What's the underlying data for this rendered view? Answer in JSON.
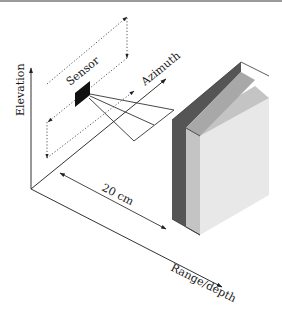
{
  "labels": {
    "elevation": "Elevation",
    "sensor": "Sensor",
    "azimuth": "Azimuth",
    "distance": "20 cm",
    "range": "Range/depth"
  },
  "colors": {
    "line": "#2a2a2a",
    "dotted": "#555555",
    "sensor": "#111111",
    "plate_dark": "#555555",
    "plate_mid": "#bdbdbd",
    "plate_light": "#e6e6e6",
    "top_border": "#9a9a9a"
  },
  "icons": {
    "arrowhead": "arrowhead-icon"
  }
}
